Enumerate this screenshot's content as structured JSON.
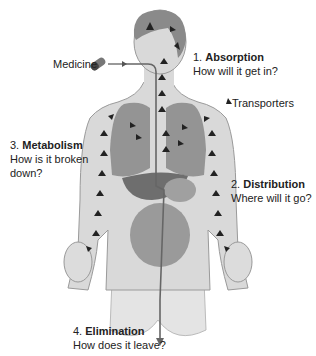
{
  "labels": {
    "medicine": "Medicine",
    "transporters": "Transporters",
    "absorption": {
      "num": "1. ",
      "title": "Absorption",
      "question": "How will it get in?"
    },
    "distribution": {
      "num": "2. ",
      "title": "Distribution",
      "question": "Where will it go?"
    },
    "metabolism": {
      "num": "3. ",
      "title": "Metabolism",
      "question_line1": "How is it broken",
      "question_line2": "down?"
    },
    "elimination": {
      "num": "4. ",
      "title": "Elimination",
      "question": "How does it leave?"
    }
  },
  "colors": {
    "skin": "#d9d9d9",
    "skin_outline": "#9a9a9a",
    "hair": "#8a8a8a",
    "organs": "#8c8c8c",
    "liver": "#6e6e6e",
    "arrow": "#333333"
  }
}
